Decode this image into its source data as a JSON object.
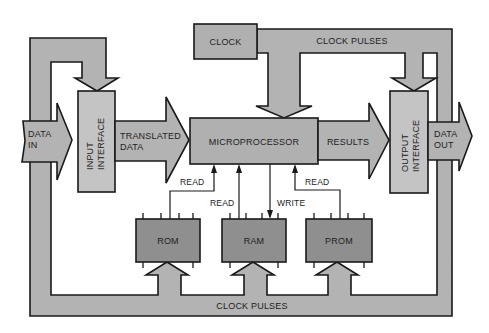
{
  "diagram": {
    "colors": {
      "bus_fill": "#b3b3b3",
      "box_fill": "#c4c4c4",
      "chip_fill": "#8f8f8f",
      "outline": "#1a1a1a",
      "background": "#ffffff"
    },
    "nodes": {
      "clock": "CLOCK",
      "input_interface_line1": "INPUT",
      "input_interface_line2": "INTERFACE",
      "microprocessor": "MICROPROCESSOR",
      "output_interface_line1": "OUTPUT",
      "output_interface_line2": "INTERFACE",
      "rom": "ROM",
      "ram": "RAM",
      "prom": "PROM"
    },
    "arrows": {
      "data_in_line1": "DATA",
      "data_in_line2": "IN",
      "translated_data_line1": "TRANSLATED",
      "translated_data_line2": "DATA",
      "results": "RESULTS",
      "data_out_line1": "DATA",
      "data_out_line2": "OUT"
    },
    "buses": {
      "clock_pulses_top": "CLOCK PULSES",
      "clock_pulses_bottom": "CLOCK PULSES"
    },
    "signals": {
      "rom_read": "READ",
      "ram_read": "READ",
      "ram_write": "WRITE",
      "prom_read": "READ"
    },
    "edges": [
      {
        "from": "DATA IN",
        "to": "INPUT INTERFACE"
      },
      {
        "from": "INPUT INTERFACE",
        "to": "MICROPROCESSOR",
        "label": "TRANSLATED DATA"
      },
      {
        "from": "MICROPROCESSOR",
        "to": "OUTPUT INTERFACE",
        "label": "RESULTS"
      },
      {
        "from": "OUTPUT INTERFACE",
        "to": "DATA OUT"
      },
      {
        "from": "CLOCK",
        "to": "MICROPROCESSOR",
        "label": "CLOCK PULSES"
      },
      {
        "from": "CLOCK",
        "to": "OUTPUT INTERFACE",
        "label": "CLOCK PULSES"
      },
      {
        "from": "CLOCK",
        "to": "INPUT INTERFACE",
        "label": "CLOCK PULSES"
      },
      {
        "from": "CLOCK",
        "to": "ROM",
        "label": "CLOCK PULSES"
      },
      {
        "from": "CLOCK",
        "to": "RAM",
        "label": "CLOCK PULSES"
      },
      {
        "from": "CLOCK",
        "to": "PROM",
        "label": "CLOCK PULSES"
      },
      {
        "from": "ROM",
        "to": "MICROPROCESSOR",
        "label": "READ"
      },
      {
        "from": "RAM",
        "to": "MICROPROCESSOR",
        "label": "READ"
      },
      {
        "from": "MICROPROCESSOR",
        "to": "RAM",
        "label": "WRITE"
      },
      {
        "from": "PROM",
        "to": "MICROPROCESSOR",
        "label": "READ"
      }
    ]
  }
}
